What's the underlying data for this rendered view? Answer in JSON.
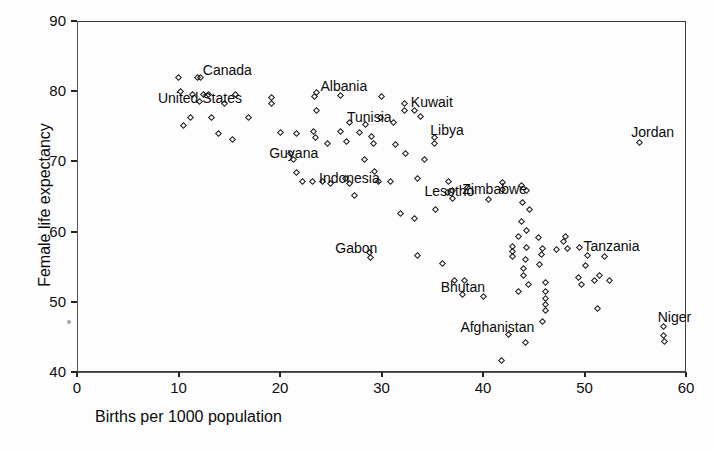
{
  "chart_data": {
    "type": "scatter",
    "title": "",
    "xlabel": "Births per 1000 population",
    "ylabel": "Female life expectancy",
    "xlim": [
      0,
      60
    ],
    "ylim": [
      40,
      90
    ],
    "xticks": [
      0,
      10,
      20,
      30,
      40,
      50,
      60
    ],
    "yticks": [
      40,
      50,
      60,
      70,
      80,
      90
    ],
    "grid": false,
    "legend": null,
    "marker": "open-diamond",
    "annotations": [
      {
        "label": "Canada",
        "x": 12.2,
        "y": 81.9
      },
      {
        "label": "United States",
        "x": 12.5,
        "y": 79.6
      },
      {
        "label": "Albania",
        "x": 23.6,
        "y": 79.8
      },
      {
        "label": "Kuwait",
        "x": 32.3,
        "y": 77.3
      },
      {
        "label": "Tunisia",
        "x": 26.8,
        "y": 75.6
      },
      {
        "label": "Jordan",
        "x": 55.4,
        "y": 72.7
      },
      {
        "label": "Libya",
        "x": 35.2,
        "y": 73.4
      },
      {
        "label": "Guyana",
        "x": 21.3,
        "y": 70.2
      },
      {
        "label": "Indonesia",
        "x": 26.8,
        "y": 66.8
      },
      {
        "label": "Lesotho",
        "x": 37.0,
        "y": 65.8
      },
      {
        "label": "Zimbabwe",
        "x": 41.9,
        "y": 66.0
      },
      {
        "label": "Tanzania",
        "x": 49.5,
        "y": 57.7
      },
      {
        "label": "Gabon",
        "x": 28.8,
        "y": 57.0
      },
      {
        "label": "Bhutan",
        "x": 38.0,
        "y": 51.1
      },
      {
        "label": "Afghanistan",
        "x": 42.5,
        "y": 45.4
      },
      {
        "label": "Niger",
        "x": 57.8,
        "y": 46.5
      }
    ],
    "points": [
      {
        "x": 10.0,
        "y": 81.9
      },
      {
        "x": 11.9,
        "y": 81.9
      },
      {
        "x": 10.2,
        "y": 79.9
      },
      {
        "x": 11.4,
        "y": 79.6
      },
      {
        "x": 13.0,
        "y": 79.6
      },
      {
        "x": 15.6,
        "y": 79.5
      },
      {
        "x": 12.1,
        "y": 78.5
      },
      {
        "x": 14.5,
        "y": 78.3
      },
      {
        "x": 19.2,
        "y": 79.1
      },
      {
        "x": 19.2,
        "y": 78.3
      },
      {
        "x": 23.4,
        "y": 79.3
      },
      {
        "x": 26.0,
        "y": 79.4
      },
      {
        "x": 30.0,
        "y": 79.2
      },
      {
        "x": 23.6,
        "y": 77.2
      },
      {
        "x": 32.3,
        "y": 78.3
      },
      {
        "x": 33.3,
        "y": 77.2
      },
      {
        "x": 33.8,
        "y": 76.4
      },
      {
        "x": 11.2,
        "y": 76.3
      },
      {
        "x": 13.3,
        "y": 76.3
      },
      {
        "x": 16.9,
        "y": 76.3
      },
      {
        "x": 10.5,
        "y": 75.1
      },
      {
        "x": 29.9,
        "y": 76.2
      },
      {
        "x": 28.4,
        "y": 75.3
      },
      {
        "x": 31.2,
        "y": 75.5
      },
      {
        "x": 13.9,
        "y": 74.0
      },
      {
        "x": 15.3,
        "y": 73.1
      },
      {
        "x": 20.0,
        "y": 74.1
      },
      {
        "x": 21.6,
        "y": 74.0
      },
      {
        "x": 23.3,
        "y": 74.2
      },
      {
        "x": 23.5,
        "y": 73.4
      },
      {
        "x": 26.0,
        "y": 74.2
      },
      {
        "x": 27.8,
        "y": 74.1
      },
      {
        "x": 24.7,
        "y": 72.5
      },
      {
        "x": 26.6,
        "y": 72.9
      },
      {
        "x": 29.0,
        "y": 73.6
      },
      {
        "x": 29.2,
        "y": 72.6
      },
      {
        "x": 31.4,
        "y": 72.4
      },
      {
        "x": 35.2,
        "y": 72.5
      },
      {
        "x": 21.0,
        "y": 71.1
      },
      {
        "x": 21.6,
        "y": 68.4
      },
      {
        "x": 28.3,
        "y": 70.2
      },
      {
        "x": 29.3,
        "y": 68.6
      },
      {
        "x": 32.4,
        "y": 71.1
      },
      {
        "x": 34.2,
        "y": 70.2
      },
      {
        "x": 26.5,
        "y": 67.5
      },
      {
        "x": 24.2,
        "y": 67.2
      },
      {
        "x": 25.0,
        "y": 66.9
      },
      {
        "x": 29.7,
        "y": 67.1
      },
      {
        "x": 30.9,
        "y": 67.2
      },
      {
        "x": 22.2,
        "y": 67.2
      },
      {
        "x": 23.2,
        "y": 67.2
      },
      {
        "x": 27.3,
        "y": 65.2
      },
      {
        "x": 33.5,
        "y": 67.6
      },
      {
        "x": 36.6,
        "y": 67.2
      },
      {
        "x": 38.5,
        "y": 66.3
      },
      {
        "x": 41.9,
        "y": 67.0
      },
      {
        "x": 43.8,
        "y": 66.6
      },
      {
        "x": 44.3,
        "y": 65.8
      },
      {
        "x": 36.5,
        "y": 65.6
      },
      {
        "x": 37.0,
        "y": 64.7
      },
      {
        "x": 40.5,
        "y": 64.6
      },
      {
        "x": 43.9,
        "y": 64.2
      },
      {
        "x": 44.6,
        "y": 63.2
      },
      {
        "x": 35.3,
        "y": 63.2
      },
      {
        "x": 31.9,
        "y": 62.6
      },
      {
        "x": 33.3,
        "y": 61.8
      },
      {
        "x": 43.8,
        "y": 61.4
      },
      {
        "x": 44.3,
        "y": 60.1
      },
      {
        "x": 43.5,
        "y": 59.3
      },
      {
        "x": 45.5,
        "y": 59.1
      },
      {
        "x": 48.1,
        "y": 59.3
      },
      {
        "x": 47.9,
        "y": 58.6
      },
      {
        "x": 28.9,
        "y": 56.3
      },
      {
        "x": 42.9,
        "y": 57.9
      },
      {
        "x": 42.9,
        "y": 57.1
      },
      {
        "x": 44.3,
        "y": 57.7
      },
      {
        "x": 45.9,
        "y": 57.6
      },
      {
        "x": 47.2,
        "y": 57.5
      },
      {
        "x": 48.3,
        "y": 57.6
      },
      {
        "x": 42.9,
        "y": 56.4
      },
      {
        "x": 45.8,
        "y": 56.7
      },
      {
        "x": 50.3,
        "y": 56.6
      },
      {
        "x": 52.0,
        "y": 56.5
      },
      {
        "x": 33.5,
        "y": 56.6
      },
      {
        "x": 36.0,
        "y": 55.5
      },
      {
        "x": 44.2,
        "y": 56.0
      },
      {
        "x": 45.6,
        "y": 55.3
      },
      {
        "x": 44.0,
        "y": 54.7
      },
      {
        "x": 50.1,
        "y": 55.2
      },
      {
        "x": 44.0,
        "y": 53.7
      },
      {
        "x": 49.4,
        "y": 53.5
      },
      {
        "x": 51.5,
        "y": 53.8
      },
      {
        "x": 51.0,
        "y": 53.0
      },
      {
        "x": 52.5,
        "y": 53.0
      },
      {
        "x": 37.2,
        "y": 53.0
      },
      {
        "x": 38.2,
        "y": 53.1
      },
      {
        "x": 44.5,
        "y": 52.4
      },
      {
        "x": 46.2,
        "y": 52.8
      },
      {
        "x": 49.7,
        "y": 52.4
      },
      {
        "x": 43.5,
        "y": 51.5
      },
      {
        "x": 46.2,
        "y": 51.5
      },
      {
        "x": 40.0,
        "y": 50.7
      },
      {
        "x": 46.2,
        "y": 50.5
      },
      {
        "x": 46.2,
        "y": 49.6
      },
      {
        "x": 46.2,
        "y": 48.7
      },
      {
        "x": 51.3,
        "y": 49.0
      },
      {
        "x": 45.9,
        "y": 47.2
      },
      {
        "x": 57.8,
        "y": 45.2
      },
      {
        "x": 57.9,
        "y": 44.4
      },
      {
        "x": 44.2,
        "y": 44.2
      },
      {
        "x": 41.8,
        "y": 41.7
      }
    ]
  }
}
